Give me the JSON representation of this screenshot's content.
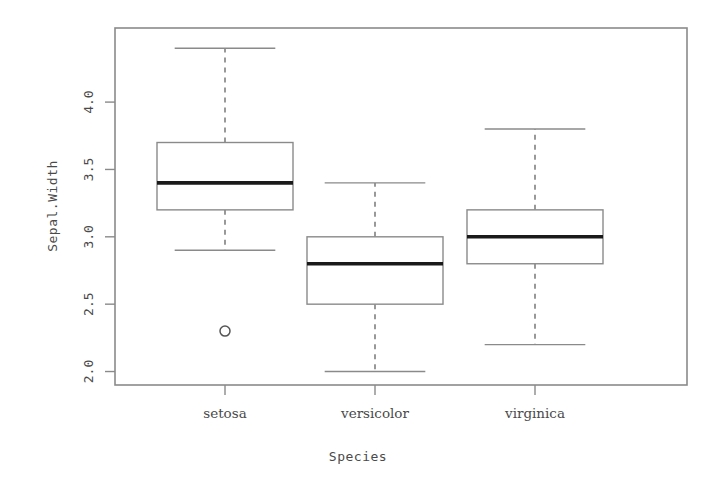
{
  "chart_data": {
    "type": "box",
    "title": "",
    "xlabel": "Species",
    "ylabel": "Sepal.Width",
    "categories": [
      "setosa",
      "versicolor",
      "virginica"
    ],
    "ylim": [
      1.9,
      4.55
    ],
    "yticks": [
      2.0,
      2.5,
      3.0,
      3.5,
      4.0
    ],
    "ytick_labels": [
      "2.0",
      "2.5",
      "3.0",
      "3.5",
      "4.0"
    ],
    "grid": false,
    "legend": "none",
    "boxes": [
      {
        "category": "setosa",
        "whisker_low": 2.9,
        "q1": 3.2,
        "median": 3.4,
        "q3": 3.7,
        "whisker_high": 4.4,
        "outliers": [
          2.3
        ]
      },
      {
        "category": "versicolor",
        "whisker_low": 2.0,
        "q1": 2.5,
        "median": 2.8,
        "q3": 3.0,
        "whisker_high": 3.4,
        "outliers": []
      },
      {
        "category": "virginica",
        "whisker_low": 2.2,
        "q1": 2.8,
        "median": 3.0,
        "q3": 3.2,
        "whisker_high": 3.8,
        "outliers": []
      }
    ],
    "colors": {
      "background": "#ffffff",
      "frame": "#8a8a8a",
      "box_stroke": "#8a8a8a",
      "box_fill": "#ffffff",
      "median": "#1a1a1a",
      "whisker": "#6e6e6e",
      "outlier": "#555555",
      "text": "#4a4a4a"
    },
    "layout": {
      "plot_left": 115,
      "plot_right": 687,
      "plot_top": 28,
      "plot_bottom": 385,
      "box_centers": [
        225,
        375,
        535
      ],
      "box_width": 136
    }
  }
}
